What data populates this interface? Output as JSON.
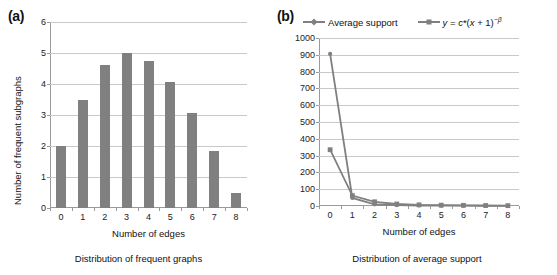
{
  "figure": {
    "panels": [
      {
        "label": "(a)",
        "caption": "Distribution of frequent graphs",
        "xlabel": "Number of edges",
        "ylabel": "Number of frequent subgraphs"
      },
      {
        "label": "(b)",
        "caption": "Distribution of average support",
        "xlabel": "Number of edges",
        "ylabel": ""
      }
    ],
    "colors": {
      "bar": "#808080",
      "line": "#808080",
      "grid": "#c9c9c9",
      "axis": "#9a9a9a",
      "text": "#111111"
    }
  },
  "chart_data": [
    {
      "type": "bar",
      "panel": "(a)",
      "title": "Distribution of frequent graphs",
      "xlabel": "Number of edges",
      "ylabel": "Number of frequent subgraphs",
      "categories": [
        "0",
        "1",
        "2",
        "3",
        "4",
        "5",
        "6",
        "7",
        "8"
      ],
      "values": [
        2.0,
        3.5,
        4.6,
        5.0,
        4.75,
        4.05,
        3.05,
        1.85,
        0.5
      ],
      "ylim": [
        0,
        6
      ],
      "ytick_labels": [
        "0",
        "1",
        "2",
        "3",
        "4",
        "5",
        "6"
      ],
      "yticks": [
        0,
        1,
        2,
        3,
        4,
        5,
        6
      ],
      "grid": true,
      "legend": null
    },
    {
      "type": "line",
      "panel": "(b)",
      "title": "Distribution of average support",
      "xlabel": "Number of edges",
      "ylabel": "",
      "x": [
        0,
        1,
        2,
        3,
        4,
        5,
        6,
        7,
        8
      ],
      "xtick_labels": [
        "0",
        "1",
        "2",
        "3",
        "4",
        "5",
        "6",
        "7",
        "8"
      ],
      "ylim": [
        0,
        1000
      ],
      "yticks": [
        0,
        100,
        200,
        300,
        400,
        500,
        600,
        700,
        800,
        900,
        1000
      ],
      "ytick_labels": [
        "0",
        "100",
        "200",
        "300",
        "400",
        "500",
        "600",
        "700",
        "800",
        "900",
        "1000"
      ],
      "grid": true,
      "legend_position": "top",
      "series": [
        {
          "name": "Average support",
          "marker": "diamond",
          "values": [
            905,
            48,
            10,
            5,
            3,
            2,
            2,
            1,
            1
          ]
        },
        {
          "name": "y = c*(x + 1)^-β",
          "name_parts": {
            "y": "y",
            "eq": " = ",
            "c": "c",
            "star": "*(",
            "x": "x",
            "plus": " + 1)",
            "exp": "−β"
          },
          "marker": "square",
          "values": [
            335,
            62,
            25,
            12,
            7,
            5,
            4,
            3,
            2
          ]
        }
      ]
    }
  ]
}
